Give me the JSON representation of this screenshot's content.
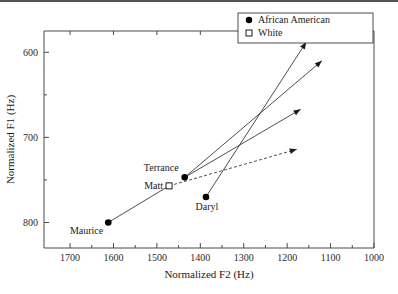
{
  "figure": {
    "caption_faint": "",
    "has_top_rule": true
  },
  "chart_data": {
    "type": "scatter",
    "title": "",
    "xlabel": "Normalized F2  (Hz)",
    "ylabel": "Normalized F1  (Hz)",
    "x_ticks": [
      1700,
      1600,
      1500,
      1400,
      1300,
      1200,
      1100,
      1000
    ],
    "y_ticks": [
      600,
      700,
      800
    ],
    "x_minor_ticks": [
      1650,
      1550,
      1450,
      1350,
      1250,
      1150,
      1050
    ],
    "y_minor_ticks": [
      650,
      750
    ],
    "xlim": [
      1760,
      1000
    ],
    "ylim": [
      575,
      830
    ],
    "x_axis_reversed": true,
    "grid": false,
    "legend_position": "top-right",
    "legend": [
      {
        "label": "African American",
        "marker": "filled-circle"
      },
      {
        "label": "White",
        "marker": "open-square"
      }
    ],
    "points": [
      {
        "name": "Maurice",
        "group": "African American",
        "marker": "filled-circle",
        "F2": 1612,
        "F1": 800,
        "label_pos": "below-left"
      },
      {
        "name": "Terrance",
        "group": "African American",
        "marker": "filled-circle",
        "F2": 1436,
        "F1": 747,
        "label_pos": "above-left"
      },
      {
        "name": "Matt",
        "group": "White",
        "marker": "open-square",
        "F2": 1472,
        "F1": 757,
        "label_pos": "left"
      },
      {
        "name": "Daryl",
        "group": "African American",
        "marker": "filled-circle",
        "F2": 1387,
        "F1": 770,
        "label_pos": "below-right"
      }
    ],
    "vectors": [
      {
        "from": "Daryl",
        "from_F2": 1387,
        "from_F1": 770,
        "to_F2": 1156,
        "to_F1": 588,
        "style": "solid",
        "arrow": true
      },
      {
        "from": "Terrance",
        "from_F2": 1436,
        "from_F1": 747,
        "to_F2": 1120,
        "to_F1": 610,
        "style": "solid",
        "arrow": true
      },
      {
        "from": "Terrance",
        "from_F2": 1436,
        "from_F1": 747,
        "to_F2": 1169,
        "to_F1": 667,
        "style": "solid",
        "arrow": true
      },
      {
        "from": "Matt",
        "from_F2": 1472,
        "from_F1": 757,
        "to_F2": 1178,
        "to_F1": 714,
        "style": "dashed",
        "arrow": true
      },
      {
        "from": "Maurice",
        "from_F2": 1612,
        "from_F1": 800,
        "to_F2": 1472,
        "to_F1": 757,
        "style": "solid",
        "arrow": false
      }
    ]
  }
}
